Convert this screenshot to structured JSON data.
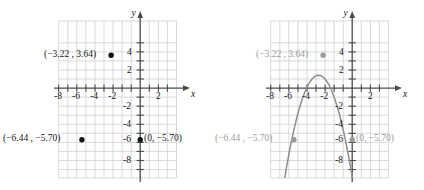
{
  "figure": {
    "type": "coordinate-plane-pair",
    "colors": {
      "grid": "#cfcfd8",
      "axis": "#4a4a4a",
      "point_left": "#111111",
      "point_right": "#8e8e8e",
      "curve": "#8e8e8e",
      "text_left": "#161616",
      "text_right": "#9a9a9a",
      "background": "#ffffff"
    }
  },
  "axes": {
    "x_label": "x",
    "y_label": "y",
    "x_ticks": [
      "-8",
      "-6",
      "-4",
      "-2",
      "2"
    ],
    "y_ticks": [
      "4",
      "2",
      "-2",
      "-4",
      "-6",
      "-8"
    ],
    "x_tick_values": [
      -8,
      -6,
      -4,
      -2,
      2
    ],
    "y_tick_values": [
      4,
      2,
      -2,
      -4,
      -6,
      -8
    ],
    "xlim": [
      -9,
      3
    ],
    "ylim": [
      -9,
      5
    ],
    "grid": true,
    "tick_step": 1,
    "label_step": 2
  },
  "points": [
    {
      "id": "vertex",
      "label": "(−3.22 , 3.64)",
      "x": -3.22,
      "y": 3.64,
      "label_side": "left"
    },
    {
      "id": "left-root",
      "label": "(−6.44 , −5.70)",
      "x": -6.44,
      "y": -5.7,
      "label_side": "left"
    },
    {
      "id": "y-intercept",
      "label": "(0, −5.70)",
      "x": 0,
      "y": -5.7,
      "label_side": "right"
    }
  ],
  "left_panel": {
    "name": "points-only-grid",
    "has_curve": false,
    "point_labels": [
      "(−3.22 , 3.64)",
      "(−6.44 , −5.70)",
      "(0, −5.70)"
    ]
  },
  "right_panel": {
    "name": "parabola-grid",
    "has_curve": true,
    "curve": {
      "type": "parabola",
      "orientation": "opens-down",
      "vertex": [
        -3.22,
        3.64
      ],
      "passes_through": [
        [
          -6.44,
          -5.7
        ],
        [
          0,
          -5.7
        ]
      ],
      "a": -0.9,
      "equation_implied": "y = a(x + 3.22)^2 + 3.64"
    },
    "point_labels": [
      "(−3.22 , 3.64)",
      "(−6.44 , −5.70)",
      "(0, −5.70)"
    ]
  }
}
